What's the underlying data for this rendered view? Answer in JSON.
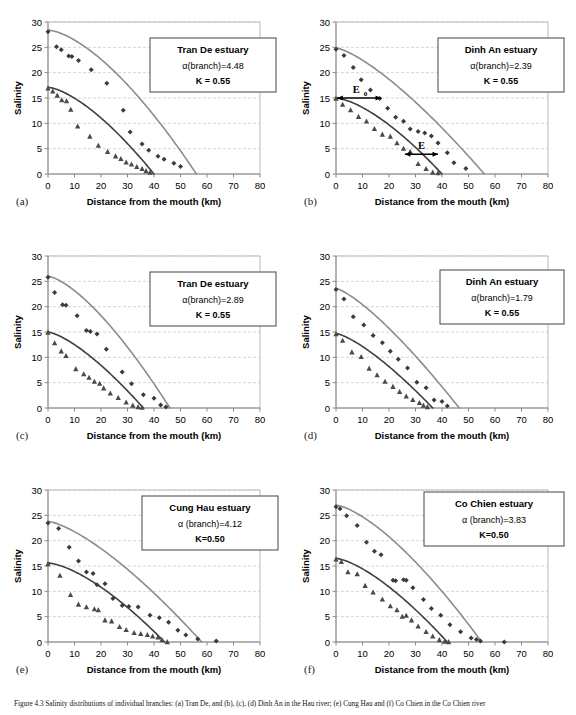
{
  "figure": {
    "caption": "Figure 4.3 Salinity distributions of individual branches: (a) Tran De, and (b), (c), (d) Dinh An in the Hau river; (e) Cung Hau and (f) Co Chien in the Co Chien river",
    "background": "#ffffff",
    "series_colors": {
      "diamond_curve": "#8c8c8c",
      "diamond_marker": "#3b3b3b",
      "triangle_curve": "#3f3f3f",
      "triangle_marker": "#4a4a4a",
      "grid": "#b8c4d9",
      "axis": "#8a8a8a",
      "plot_border": "#9a9a9a"
    },
    "axes": {
      "xlabel": "Distance from the mouth (km)",
      "ylabel": "Salinity",
      "xticks": [
        0,
        10,
        20,
        30,
        40,
        50,
        60,
        70,
        80
      ],
      "yticks": [
        0,
        5,
        10,
        15,
        20,
        25,
        30
      ],
      "xlim": [
        0,
        80
      ],
      "ylim": [
        0,
        30
      ],
      "grid": "horizontal-dashed"
    }
  },
  "chart_data": [
    {
      "id": "a",
      "letter": "(a)",
      "type": "scatter",
      "title": "Tran De estuary",
      "alpha_label": "α(branch)=4.48",
      "k_label": "K = 0.55",
      "xlabel": "Distance from the mouth (km)",
      "ylabel": "Salinity",
      "xlim": [
        0,
        80
      ],
      "ylim": [
        0,
        30
      ],
      "xticks": [
        0,
        10,
        20,
        30,
        40,
        50,
        60,
        70,
        80
      ],
      "yticks": [
        0,
        5,
        10,
        15,
        20,
        25,
        30
      ],
      "series": [
        {
          "name": "HWS observed",
          "marker": "diamond",
          "x": [
            0,
            3.2,
            5.0,
            7.8,
            9.0,
            11.5,
            16.3,
            22.2,
            28.4,
            31.0,
            35.5,
            38.0,
            41.5,
            43.8,
            47.5,
            50.0
          ],
          "y": [
            28.1,
            25.1,
            24.5,
            23.3,
            23.2,
            22.4,
            20.6,
            17.9,
            12.6,
            8.3,
            5.9,
            4.7,
            3.5,
            2.9,
            2.1,
            1.5
          ]
        },
        {
          "name": "LWS observed",
          "marker": "triangle",
          "x": [
            0,
            1.8,
            3.5,
            5.2,
            7.0,
            8.6,
            11.2,
            15.8,
            19.0,
            22.5,
            25.5,
            27.5,
            29.5,
            31.5,
            33.5,
            35.5,
            37.0,
            38.5
          ],
          "y": [
            16.9,
            16.3,
            15.5,
            14.6,
            14.4,
            12.7,
            9.4,
            7.4,
            5.6,
            4.4,
            3.5,
            3.0,
            2.3,
            1.9,
            1.4,
            1.0,
            0.6,
            0.3
          ]
        }
      ],
      "fits": [
        {
          "name": "HWS fit",
          "color": "diamond_curve",
          "x0": 0,
          "y0": 28.4,
          "xend": 56.0,
          "shape": 1.55
        },
        {
          "name": "LWS fit",
          "color": "triangle_curve",
          "x0": 0,
          "y0": 17.1,
          "xend": 40.0,
          "shape": 1.5
        }
      ],
      "annotations": []
    },
    {
      "id": "b",
      "letter": "(b)",
      "type": "scatter",
      "title": "Dinh An estuary",
      "alpha_label": "α(branch)=2.39",
      "k_label": "K = 0.55",
      "xlabel": "Distance from the mouth (km)",
      "ylabel": "Salinity",
      "xlim": [
        0,
        80
      ],
      "ylim": [
        0,
        30
      ],
      "xticks": [
        0,
        10,
        20,
        30,
        40,
        50,
        60,
        70,
        80
      ],
      "yticks": [
        0,
        5,
        10,
        15,
        20,
        25,
        30
      ],
      "series": [
        {
          "name": "HWS observed",
          "marker": "diamond",
          "x": [
            0,
            3.0,
            6.5,
            9.5,
            13.0,
            16.5,
            19.5,
            22.5,
            25.5,
            28.0,
            31.0,
            33.5,
            36.0,
            38.5,
            42.0,
            44.5,
            49.0
          ],
          "y": [
            24.6,
            23.4,
            21.0,
            18.6,
            16.6,
            14.9,
            13.0,
            11.2,
            10.4,
            8.9,
            8.4,
            8.1,
            7.5,
            6.1,
            4.2,
            2.2,
            1.1
          ]
        },
        {
          "name": "LWS observed",
          "marker": "triangle",
          "x": [
            0,
            2.5,
            5.5,
            8.5,
            11.5,
            14.5,
            17.5,
            20.5,
            23.0,
            25.5,
            28.0,
            31.0,
            34.0,
            36.5,
            38.5
          ],
          "y": [
            14.9,
            13.7,
            12.6,
            11.3,
            10.4,
            8.9,
            7.8,
            7.4,
            6.1,
            5.0,
            4.4,
            2.0,
            1.0,
            0.3,
            0.2
          ]
        }
      ],
      "fits": [
        {
          "name": "HWS fit",
          "color": "diamond_curve",
          "x0": 0,
          "y0": 24.9,
          "xend": 56.0,
          "shape": 1.35
        },
        {
          "name": "LWS fit",
          "color": "triangle_curve",
          "x0": 0,
          "y0": 15.0,
          "xend": 40.0,
          "shape": 1.5
        }
      ],
      "annotations": [
        {
          "name": "E0-arrow",
          "label": "E",
          "subscript": "0",
          "y": 15.0,
          "x_from": 0.5,
          "x_to": 17.0
        },
        {
          "name": "E-arrow",
          "label": "E",
          "subscript": "",
          "y": 3.9,
          "x_from": 26.0,
          "x_to": 38.5
        }
      ]
    },
    {
      "id": "c",
      "letter": "(c)",
      "type": "scatter",
      "title": "Tran De estuary",
      "alpha_label": "α(branch)=2.89",
      "k_label": "K = 0.55",
      "xlabel": "Distance from the mouth (km)",
      "ylabel": "Salinity",
      "xlim": [
        0,
        80
      ],
      "ylim": [
        0,
        30
      ],
      "xticks": [
        0,
        10,
        20,
        30,
        40,
        50,
        60,
        70,
        80
      ],
      "yticks": [
        0,
        5,
        10,
        15,
        20,
        25,
        30
      ],
      "series": [
        {
          "name": "HWS observed",
          "marker": "diamond",
          "x": [
            0,
            2.5,
            5.5,
            6.8,
            11.0,
            14.5,
            16.0,
            18.5,
            22.0,
            28.0,
            31.5,
            36.0,
            40.0,
            42.5,
            44.5
          ],
          "y": [
            25.8,
            22.8,
            20.4,
            20.3,
            18.2,
            15.3,
            15.1,
            14.6,
            11.6,
            7.1,
            4.8,
            2.6,
            1.9,
            0.6,
            0.2
          ]
        },
        {
          "name": "LWS observed",
          "marker": "triangle",
          "x": [
            0,
            2.5,
            5.0,
            6.8,
            10.5,
            13.5,
            15.5,
            17.5,
            19.5,
            21.0,
            23.5,
            26.5,
            29.5,
            32.0,
            34.0,
            35.5
          ],
          "y": [
            14.9,
            12.8,
            11.2,
            10.3,
            7.7,
            6.7,
            6.0,
            5.2,
            4.8,
            3.9,
            2.9,
            2.0,
            1.1,
            0.5,
            0.2,
            0.1
          ]
        }
      ],
      "fits": [
        {
          "name": "HWS fit",
          "color": "diamond_curve",
          "x0": 0,
          "y0": 26.0,
          "xend": 46.0,
          "shape": 1.45
        },
        {
          "name": "LWS fit",
          "color": "triangle_curve",
          "x0": 0,
          "y0": 15.0,
          "xend": 36.0,
          "shape": 1.4
        }
      ],
      "annotations": []
    },
    {
      "id": "d",
      "letter": "(d)",
      "type": "scatter",
      "title": "Dinh An estuary",
      "alpha_label": "α(branch)=1.79",
      "k_label": "K = 0.55",
      "xlabel": "Distance from the mouth (km)",
      "ylabel": "Salinity",
      "xlim": [
        0,
        80
      ],
      "ylim": [
        0,
        30
      ],
      "xticks": [
        0,
        10,
        20,
        30,
        40,
        50,
        60,
        70,
        80
      ],
      "yticks": [
        0,
        5,
        10,
        15,
        20,
        25,
        30
      ],
      "series": [
        {
          "name": "HWS observed",
          "marker": "diamond",
          "x": [
            0,
            3.0,
            6.5,
            10.5,
            14.0,
            17.5,
            20.5,
            23.5,
            27.0,
            30.5,
            34.0,
            37.0,
            40.0,
            42.0
          ],
          "y": [
            23.4,
            21.5,
            18.0,
            16.4,
            14.3,
            12.9,
            11.2,
            9.6,
            7.9,
            5.1,
            4.0,
            1.6,
            1.3,
            0.4
          ]
        },
        {
          "name": "LWS observed",
          "marker": "triangle",
          "x": [
            0,
            2.5,
            6.0,
            9.5,
            12.5,
            15.5,
            18.5,
            21.5,
            24.0,
            26.5,
            29.0,
            31.5,
            33.0,
            34.5
          ],
          "y": [
            14.6,
            13.3,
            11.0,
            10.1,
            7.8,
            6.5,
            5.2,
            4.2,
            3.2,
            2.3,
            1.6,
            1.0,
            0.5,
            0.2
          ]
        }
      ],
      "fits": [
        {
          "name": "HWS fit",
          "color": "diamond_curve",
          "x0": 0,
          "y0": 23.6,
          "xend": 46.5,
          "shape": 1.3
        },
        {
          "name": "LWS fit",
          "color": "triangle_curve",
          "x0": 0,
          "y0": 14.7,
          "xend": 36.5,
          "shape": 1.35
        }
      ],
      "annotations": []
    },
    {
      "id": "e",
      "letter": "(e)",
      "type": "scatter",
      "title": "Cung Hau estuary",
      "alpha_label": "α (branch)=4.12",
      "k_label": "K=0.50",
      "xlabel": "Distance from the mouth (km)",
      "ylabel": "Salinity",
      "xlim": [
        0,
        80
      ],
      "ylim": [
        0,
        30
      ],
      "xticks": [
        0,
        10,
        20,
        30,
        40,
        50,
        60,
        70,
        80
      ],
      "yticks": [
        0,
        5,
        10,
        15,
        20,
        25,
        30
      ],
      "series": [
        {
          "name": "HWS observed",
          "marker": "diamond",
          "x": [
            0,
            4.0,
            8.0,
            11.5,
            14.5,
            17.0,
            18.5,
            21.5,
            24.5,
            28.0,
            30.5,
            34.0,
            38.5,
            42.0,
            45.5,
            49.0,
            52.0,
            56.5,
            63.5
          ],
          "y": [
            23.5,
            22.4,
            18.7,
            16.0,
            13.8,
            13.5,
            11.3,
            11.5,
            8.6,
            7.2,
            7.0,
            6.9,
            5.3,
            4.8,
            3.9,
            2.3,
            1.4,
            0.6,
            0.2
          ]
        },
        {
          "name": "LWS observed",
          "marker": "triangle",
          "x": [
            0,
            4.5,
            8.5,
            11.5,
            14.5,
            17.5,
            19.0,
            21.5,
            24.0,
            27.0,
            29.5,
            32.5,
            35.0,
            37.5,
            39.5,
            41.5,
            43.0,
            45.0
          ],
          "y": [
            15.4,
            13.1,
            9.3,
            7.4,
            6.9,
            6.5,
            6.3,
            4.3,
            4.1,
            3.0,
            2.4,
            1.8,
            1.6,
            1.4,
            1.1,
            0.9,
            0.4,
            0.0
          ]
        }
      ],
      "fits": [
        {
          "name": "HWS fit",
          "color": "diamond_curve",
          "x0": 0,
          "y0": 23.8,
          "xend": 58.0,
          "shape": 1.4
        },
        {
          "name": "LWS fit",
          "color": "triangle_curve",
          "x0": 0,
          "y0": 15.6,
          "xend": 44.0,
          "shape": 1.5
        }
      ],
      "annotations": []
    },
    {
      "id": "f",
      "letter": "(f)",
      "type": "scatter",
      "title": "Co Chien estuary",
      "alpha_label": "α (branch)=3.83",
      "k_label": "K=0.50",
      "xlabel": "Distance from the mouth (km)",
      "ylabel": "Salinity",
      "xlim": [
        0,
        80
      ],
      "ylim": [
        0,
        30
      ],
      "xticks": [
        0,
        10,
        20,
        30,
        40,
        50,
        60,
        70,
        80
      ],
      "yticks": [
        0,
        5,
        10,
        15,
        20,
        25,
        30
      ],
      "series": [
        {
          "name": "HWS observed",
          "marker": "diamond",
          "x": [
            0,
            1.5,
            4.0,
            8.0,
            11.5,
            14.5,
            17.0,
            21.5,
            22.5,
            25.5,
            26.5,
            29.0,
            33.0,
            36.0,
            39.5,
            43.0,
            47.0,
            51.0,
            53.0,
            54.5,
            63.5
          ],
          "y": [
            26.7,
            26.3,
            24.9,
            23.0,
            19.7,
            17.9,
            17.2,
            12.2,
            12.1,
            12.3,
            12.2,
            10.7,
            8.4,
            6.6,
            5.3,
            3.4,
            2.0,
            0.8,
            0.5,
            0.2,
            0.0
          ]
        },
        {
          "name": "LWS observed",
          "marker": "triangle",
          "x": [
            0,
            2.0,
            4.5,
            8.0,
            11.0,
            14.0,
            17.5,
            20.5,
            23.0,
            25.0,
            26.5,
            28.5,
            31.0,
            34.0,
            36.5,
            39.0,
            41.0,
            42.5
          ],
          "y": [
            16.3,
            15.8,
            13.8,
            13.4,
            11.1,
            9.8,
            8.4,
            7.1,
            6.3,
            5.0,
            5.2,
            4.3,
            3.1,
            2.0,
            1.1,
            0.4,
            0.1,
            0.0
          ]
        }
      ],
      "fits": [
        {
          "name": "HWS fit",
          "color": "diamond_curve",
          "x0": 0,
          "y0": 27.0,
          "xend": 55.0,
          "shape": 1.45
        },
        {
          "name": "LWS fit",
          "color": "triangle_curve",
          "x0": 0,
          "y0": 16.5,
          "xend": 42.0,
          "shape": 1.45
        }
      ],
      "annotations": []
    }
  ]
}
